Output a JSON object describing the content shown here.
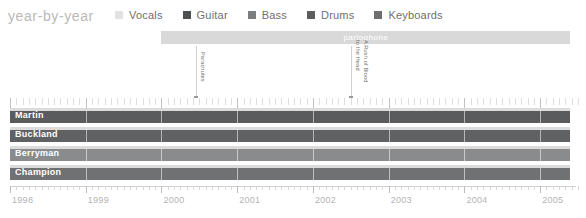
{
  "header": {
    "title": "year-by-year",
    "legend": [
      {
        "label": "Vocals",
        "color": "#e3e3e3"
      },
      {
        "label": "Guitar",
        "color": "#4f5052"
      },
      {
        "label": "Bass",
        "color": "#7c7d7f"
      },
      {
        "label": "Drums",
        "color": "#5c5d5f"
      },
      {
        "label": "Keyboards",
        "color": "#6d6e70"
      }
    ]
  },
  "label_bands": [
    {
      "name": "parlophone",
      "start_year": 2000.0,
      "end_year": 2005.4,
      "color": "#d9d9d9",
      "text_color": "#ffffff"
    }
  ],
  "annotations": [
    {
      "label_line1": "Parachutes",
      "label_line2": "",
      "year": 2000.45
    },
    {
      "label_line1": "A Rush of Blood",
      "label_line2": "to the Head",
      "year": 2002.5
    }
  ],
  "chart_data": {
    "type": "bar",
    "title": "year-by-year",
    "xlabel": "",
    "ylabel": "",
    "xlim": [
      1998,
      2005.5
    ],
    "xticks": [
      "1998",
      "1999",
      "2000",
      "2001",
      "2002",
      "2003",
      "2004",
      "2005"
    ],
    "minor_ticks_per_year": 12,
    "grid": true,
    "legend_position": "top",
    "categories": [
      "Martin",
      "Buckland",
      "Berryman",
      "Champion"
    ],
    "series": [
      {
        "name": "Vocals",
        "color": "#e3e3e3"
      },
      {
        "name": "Guitar",
        "color": "#4f5052"
      },
      {
        "name": "Bass",
        "color": "#7c7d7f"
      },
      {
        "name": "Drums",
        "color": "#5c5d5f"
      },
      {
        "name": "Keyboards",
        "color": "#6d6e70"
      }
    ],
    "rows": [
      {
        "name": "Martin",
        "start_year": 1998,
        "end_year": 2005.4,
        "bar_color": "#5a5b5d",
        "vocals_color": "#dcdcdc",
        "has_vocals": true
      },
      {
        "name": "Buckland",
        "start_year": 1998,
        "end_year": 2005.4,
        "bar_color": "#606163",
        "vocals_color": "#dcdcdc",
        "has_vocals": true
      },
      {
        "name": "Berryman",
        "start_year": 1998,
        "end_year": 2005.4,
        "bar_color": "#8a8b8d",
        "vocals_color": "#dcdcdc",
        "has_vocals": true
      },
      {
        "name": "Champion",
        "start_year": 1998,
        "end_year": 2005.4,
        "bar_color": "#707173",
        "vocals_color": "#dcdcdc",
        "has_vocals": true
      }
    ]
  },
  "axis": {
    "years": [
      "1998",
      "1999",
      "2000",
      "2001",
      "2002",
      "2003",
      "2004",
      "2005"
    ]
  }
}
